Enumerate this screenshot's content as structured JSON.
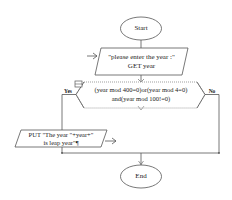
{
  "flowchart": {
    "start": {
      "label": "Start"
    },
    "input": {
      "line1": "\"please enter the year :\"",
      "line2": "GET year"
    },
    "decision": {
      "line1": "(year mod 400=0)or(year mod 4=0)",
      "line2": "and(year mod 100!=0)"
    },
    "branch_yes": {
      "label": "Yes"
    },
    "branch_no": {
      "label": "No"
    },
    "output": {
      "line1": "PUT \"The year \"+year+\"",
      "line2": "is leap year\"¶"
    },
    "end": {
      "label": "End"
    }
  },
  "colors": {
    "stroke": "#555555",
    "text": "#1a1a1a",
    "background": "#ffffff"
  }
}
